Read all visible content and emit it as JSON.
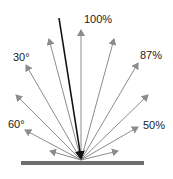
{
  "diagram": {
    "colors": {
      "reflected_ray": "#8c8c8c",
      "incident_ray": "#111111",
      "surface": "#6e6e6e",
      "label": "#222222"
    },
    "origin": {
      "x": 81,
      "y": 160
    },
    "surface": {
      "x1": 21,
      "x2": 144,
      "y": 163,
      "thickness": 4
    },
    "incident_ray": {
      "from": {
        "x": 59,
        "y": 18
      },
      "to": {
        "x": 81,
        "y": 158
      }
    },
    "reflected_rays": [
      {
        "angle_from_normal": -75,
        "tip": {
          "x": 50,
          "y": 151
        }
      },
      {
        "angle_from_normal": -60,
        "tip": {
          "x": 25,
          "y": 130
        }
      },
      {
        "angle_from_normal": -45,
        "tip": {
          "x": 16,
          "y": 95
        }
      },
      {
        "angle_from_normal": -30,
        "tip": {
          "x": 26,
          "y": 65
        }
      },
      {
        "angle_from_normal": -15,
        "tip": {
          "x": 49,
          "y": 39
        }
      },
      {
        "angle_from_normal": 0,
        "tip": {
          "x": 81,
          "y": 30
        }
      },
      {
        "angle_from_normal": 15,
        "tip": {
          "x": 114,
          "y": 39
        }
      },
      {
        "angle_from_normal": 30,
        "tip": {
          "x": 138,
          "y": 63
        }
      },
      {
        "angle_from_normal": 45,
        "tip": {
          "x": 148,
          "y": 95
        }
      },
      {
        "angle_from_normal": 60,
        "tip": {
          "x": 138,
          "y": 127
        }
      },
      {
        "angle_from_normal": 75,
        "tip": {
          "x": 118,
          "y": 151
        }
      }
    ],
    "labels": {
      "normal_intensity": {
        "text": "100%",
        "x": 84,
        "y": 23
      },
      "angle_30": {
        "text": "30°",
        "x": 13,
        "y": 61
      },
      "angle_60": {
        "text": "60°",
        "x": 8,
        "y": 128
      },
      "intensity_87": {
        "text": "87%",
        "x": 140,
        "y": 59
      },
      "intensity_50": {
        "text": "50%",
        "x": 143,
        "y": 129
      }
    }
  }
}
